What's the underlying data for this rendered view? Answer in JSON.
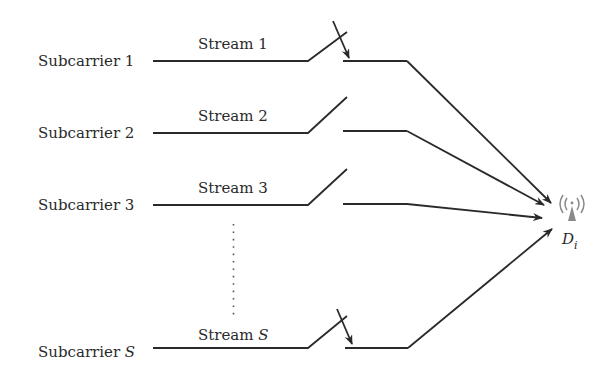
{
  "diagram": {
    "rows": [
      {
        "subcarrier": "Subcarrier 1",
        "stream": "Stream 1",
        "switch_state": "closed"
      },
      {
        "subcarrier": "Subcarrier 2",
        "stream": "Stream 2",
        "switch_state": "open"
      },
      {
        "subcarrier": "Subcarrier 3",
        "stream": "Stream 3",
        "switch_state": "open"
      },
      {
        "subcarrier": "Subcarrier ",
        "subcarrier_var": "S",
        "stream": "Stream ",
        "stream_var": "S",
        "switch_state": "closed"
      }
    ],
    "ellipsis": "vertical-dots",
    "destination": {
      "label": "D",
      "subscript": "i",
      "icon": "antenna-icon"
    },
    "colors": {
      "line": "#2a2a2a",
      "antenna": "#8a8a8a",
      "background": "#ffffff"
    }
  }
}
